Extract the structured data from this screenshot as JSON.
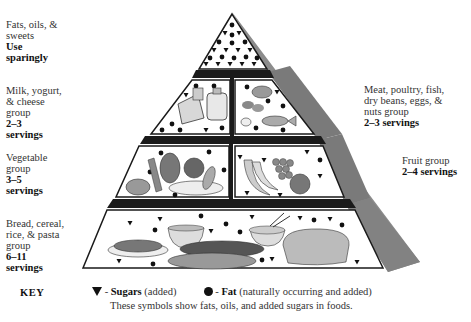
{
  "tiers": {
    "fats": {
      "lines": [
        "Fats, oils, &",
        "sweets"
      ],
      "servings_lines": [
        "Use",
        "sparingly"
      ]
    },
    "milk": {
      "lines": [
        "Milk, yogurt,",
        "& cheese",
        "group"
      ],
      "servings_lines": [
        "2–3",
        "servings"
      ]
    },
    "meat": {
      "lines": [
        "Meat, poultry, fish,",
        "dry beans, eggs, &",
        "nuts group"
      ],
      "servings_lines": [
        "2–3 servings"
      ]
    },
    "vegetable": {
      "lines": [
        "Vegetable",
        "group"
      ],
      "servings_lines": [
        "3–5",
        "servings"
      ]
    },
    "fruit": {
      "lines": [
        "Fruit group"
      ],
      "servings_lines": [
        "2–4 servings"
      ]
    },
    "bread": {
      "lines": [
        "Bread, cereal,",
        "rice, & pasta",
        "group"
      ],
      "servings_lines": [
        "6–11",
        "servings"
      ]
    }
  },
  "key": {
    "heading": "KEY",
    "sugar_icon": "triangle-down-icon",
    "sugar_label": "Sugars",
    "sugar_note": "(added)",
    "fat_icon": "circle-dot-icon",
    "fat_label": "Fat",
    "fat_note": "(naturally occurring and added)",
    "explanation": "These symbols show fats, oils, and added sugars in foods."
  },
  "colors": {
    "outline": "#1a1a1a",
    "side_shade": "#8a8a8a",
    "side_shade_dark": "#6e6e6e",
    "tier_fill": "#ffffff",
    "divider": "#1a1a1a",
    "food_gray": "#9a9a9a"
  }
}
